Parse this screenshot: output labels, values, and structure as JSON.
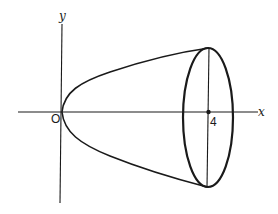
{
  "diagram": {
    "axes": {
      "x_label": "x",
      "y_label": "y",
      "origin_label": "O"
    },
    "marks": {
      "x_tick_label": "4"
    },
    "colors": {
      "stroke": "#1a1a1a",
      "background": "#ffffff"
    }
  }
}
